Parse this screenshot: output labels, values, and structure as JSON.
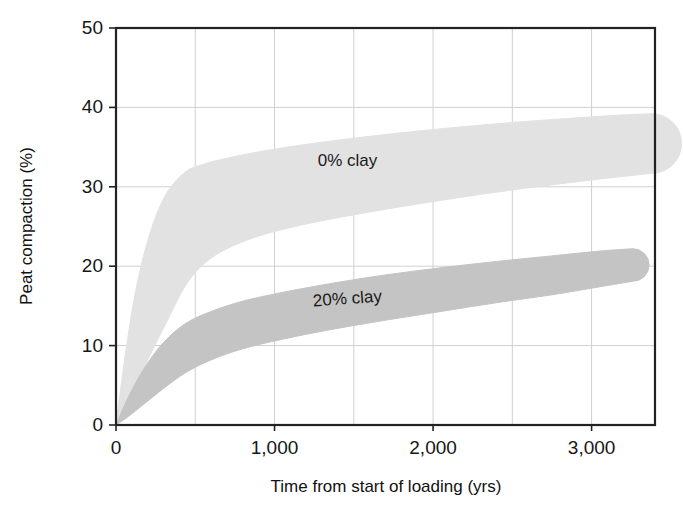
{
  "chart_data": {
    "type": "area",
    "title": "",
    "xlabel": "Time from start of loading (yrs)",
    "ylabel": "Peat compaction (%)",
    "xlim": [
      0,
      3400
    ],
    "ylim": [
      0,
      50
    ],
    "xticks": [
      0,
      1000,
      2000,
      3000
    ],
    "xtick_labels": [
      "0",
      "1,000",
      "2,000",
      "3,000"
    ],
    "yticks": [
      0,
      10,
      20,
      30,
      40,
      50
    ],
    "ytick_labels": [
      "0",
      "10",
      "20",
      "30",
      "40",
      "50"
    ],
    "x_minor_gridlines": [
      500,
      1000,
      1500,
      2000,
      2500,
      3000
    ],
    "y_gridlines": [
      10,
      20,
      30,
      40
    ],
    "grid": true,
    "legend": "inline-labels",
    "series": [
      {
        "name": "0% clay",
        "label": "0% clay",
        "color": "#e2e2e2",
        "label_x": 1460,
        "label_y": 33.2,
        "label_rotation": 0,
        "x": [
          0,
          60,
          130,
          220,
          320,
          440,
          560,
          700,
          900,
          1150,
          1450,
          1800,
          2150,
          2500,
          2850,
          3150,
          3380
        ],
        "upper": [
          0,
          9.0,
          17.5,
          24.5,
          29.2,
          31.9,
          32.9,
          33.6,
          34.4,
          35.2,
          36.0,
          36.8,
          37.5,
          38.1,
          38.6,
          39.0,
          39.2
        ],
        "lower": [
          0,
          2.2,
          5.2,
          9.0,
          13.0,
          17.6,
          20.4,
          22.2,
          23.8,
          25.1,
          26.3,
          27.5,
          28.6,
          29.6,
          30.5,
          31.2,
          31.7
        ]
      },
      {
        "name": "20% clay",
        "label": "20% clay",
        "color": "#c4c4c4",
        "label_x": 1460,
        "label_y": 15.8,
        "label_rotation": -4,
        "x": [
          0,
          80,
          180,
          300,
          440,
          600,
          800,
          1050,
          1350,
          1700,
          2050,
          2400,
          2750,
          3050,
          3260
        ],
        "upper": [
          0,
          3.6,
          7.2,
          10.4,
          12.8,
          14.3,
          15.6,
          16.7,
          17.8,
          18.9,
          19.8,
          20.6,
          21.3,
          21.9,
          22.2
        ],
        "lower": [
          0,
          1.1,
          2.7,
          4.6,
          6.6,
          8.2,
          9.6,
          10.8,
          12.0,
          13.2,
          14.3,
          15.4,
          16.4,
          17.4,
          18.1
        ]
      }
    ]
  },
  "axes": {
    "frame_color": "#222222",
    "grid_color": "#d0d0d0"
  }
}
